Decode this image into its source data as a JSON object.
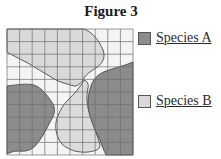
{
  "figure": {
    "title": "Figure 3",
    "grid": {
      "columns": 10,
      "rows": 10
    },
    "colors": {
      "species_a": "#8c8c8c",
      "species_b": "#d9d9d9",
      "background": "#f4f4f4",
      "grid_line": "#6e6e6e",
      "outline": "#4a4a4a"
    }
  },
  "legend": {
    "items": [
      {
        "label": "Species A",
        "swatch_color": "#8c8c8c"
      },
      {
        "label": "Species B",
        "swatch_color": "#d9d9d9"
      }
    ]
  }
}
